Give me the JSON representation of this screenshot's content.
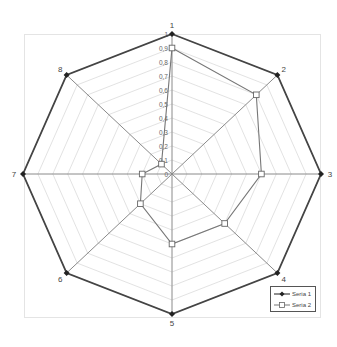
{
  "chart_data": {
    "type": "radar",
    "title": "",
    "categories": [
      "1",
      "2",
      "3",
      "4",
      "5",
      "6",
      "7",
      "8"
    ],
    "series": [
      {
        "name": "Seria 1",
        "values": [
          1,
          1,
          1,
          1,
          1,
          1,
          1,
          1
        ],
        "color": "#444444",
        "marker": "diamond-filled"
      },
      {
        "name": "Seria 2",
        "values": [
          0.9,
          0.8,
          0.6,
          0.5,
          0.5,
          0.3,
          0.2,
          0.1
        ],
        "color": "#777777",
        "marker": "square-open"
      }
    ],
    "radial_ticks": [
      "0",
      "0,1",
      "0,2",
      "0,3",
      "0,4",
      "0,5",
      "0,6",
      "0,7",
      "0,8",
      "0,9",
      "1"
    ],
    "rlim": [
      0,
      1
    ],
    "grid": true,
    "legend_position": "bottom-right"
  },
  "legend": {
    "items": [
      {
        "label": "Seria 1"
      },
      {
        "label": "Seria 2"
      }
    ]
  }
}
